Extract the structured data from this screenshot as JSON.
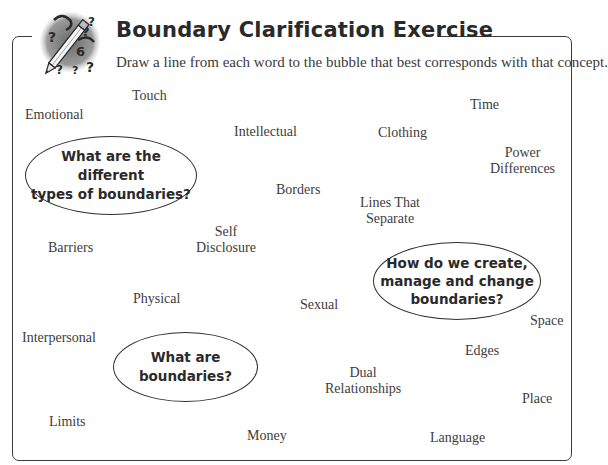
{
  "header": {
    "title": "Boundary Clarification Exercise",
    "instructions": "Draw a line from each word to the bubble that best corresponds with that concept.",
    "icon": "pencil-question-marks-icon"
  },
  "bubbles": [
    {
      "id": "types",
      "lines": [
        "What are the different",
        "types of boundaries?"
      ]
    },
    {
      "id": "manage",
      "lines": [
        "How do we create,",
        "manage and change",
        "boundaries?"
      ]
    },
    {
      "id": "definition",
      "lines": [
        "What are",
        "boundaries?"
      ]
    }
  ],
  "words": [
    {
      "lines": [
        "Touch"
      ]
    },
    {
      "lines": [
        "Emotional"
      ]
    },
    {
      "lines": [
        "Intellectual"
      ]
    },
    {
      "lines": [
        "Clothing"
      ]
    },
    {
      "lines": [
        "Time"
      ]
    },
    {
      "lines": [
        "Power",
        "Differences"
      ]
    },
    {
      "lines": [
        "Borders"
      ]
    },
    {
      "lines": [
        "Lines That",
        "Separate"
      ]
    },
    {
      "lines": [
        "Self",
        "Disclosure"
      ]
    },
    {
      "lines": [
        "Barriers"
      ]
    },
    {
      "lines": [
        "Physical"
      ]
    },
    {
      "lines": [
        "Sexual"
      ]
    },
    {
      "lines": [
        "Interpersonal"
      ]
    },
    {
      "lines": [
        "Space"
      ]
    },
    {
      "lines": [
        "Edges"
      ]
    },
    {
      "lines": [
        "Dual",
        "Relationships"
      ]
    },
    {
      "lines": [
        "Place"
      ]
    },
    {
      "lines": [
        "Limits"
      ]
    },
    {
      "lines": [
        "Money"
      ]
    },
    {
      "lines": [
        "Language"
      ]
    }
  ],
  "colors": {
    "text": "#3a3a3a",
    "border": "#3c3c3c",
    "background": "#ffffff"
  }
}
